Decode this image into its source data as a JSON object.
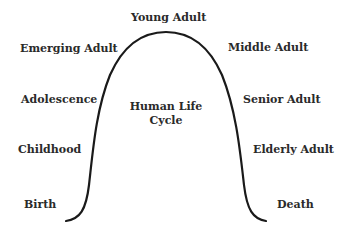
{
  "diagram": {
    "title": "Human Life Cycle",
    "center_label": {
      "line1": "Human Life",
      "line2": "Cycle"
    },
    "curve_color": "#1a1a1a",
    "text_color": "#2a2a2a",
    "left_stages": [
      {
        "label": "Emerging Adult"
      },
      {
        "label": "Adolescence"
      },
      {
        "label": "Childhood"
      },
      {
        "label": "Birth"
      }
    ],
    "peak_stage": {
      "label": "Young Adult"
    },
    "right_stages": [
      {
        "label": "Middle Adult"
      },
      {
        "label": "Senior Adult"
      },
      {
        "label": "Elderly Adult"
      },
      {
        "label": "Death"
      }
    ]
  }
}
